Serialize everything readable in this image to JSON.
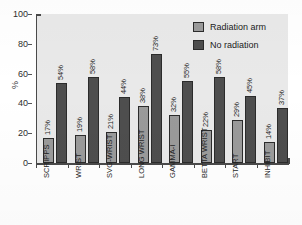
{
  "chart_data": {
    "type": "bar",
    "title": "",
    "subtitle": "",
    "xlabel": "",
    "ylabel": "%",
    "ylim": [
      0,
      100
    ],
    "ytick_labels": [
      "0",
      "20",
      "40",
      "60",
      "80",
      "100"
    ],
    "yticks": [
      0,
      20,
      40,
      60,
      80,
      100
    ],
    "grid": false,
    "legend_position": "top-right",
    "categories": [
      "SCRIPPS",
      "WRIST",
      "SVG-WRIST",
      "LONG WRIST",
      "GAMMA-I",
      "BETTA  WRIST",
      "START",
      "INHIBIT"
    ],
    "series": [
      {
        "name": "Radiation arm",
        "color": "#9a9a9a",
        "values": [
          17,
          19,
          21,
          38,
          32,
          22,
          29,
          14
        ],
        "value_labels": [
          "17%",
          "19%",
          "21%",
          "38%",
          "32%",
          "22%",
          "29%",
          "14%"
        ]
      },
      {
        "name": "No radiation",
        "color": "#4e4e4e",
        "values": [
          54,
          58,
          44,
          73,
          55,
          58,
          45,
          37
        ],
        "value_labels": [
          "54%",
          "58%",
          "44%",
          "73%",
          "55%",
          "58%",
          "45%",
          "37%"
        ]
      }
    ]
  },
  "legend": {
    "items": [
      {
        "label": "Radiation arm",
        "swatch": "light"
      },
      {
        "label": "No radiation",
        "swatch": "dark"
      }
    ]
  },
  "colors": {
    "radiation_arm": "#9a9a9a",
    "no_radiation": "#4e4e4e",
    "plot_background": "#e9e9e9",
    "axis": "#4a4a4a",
    "page_background": "#ffffff"
  }
}
